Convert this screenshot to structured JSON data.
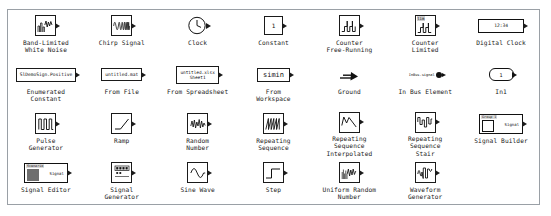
{
  "panel": {
    "title": "Sources",
    "columns": 7,
    "rows": 4,
    "border_color": "#9aa0a6",
    "background": "#ffffff",
    "text_color": "#1a1a1a"
  },
  "blocks": [
    {
      "id": "band-limited-white-noise",
      "label": "Band-Limited\nWhite Noise",
      "icon": "noise-waveform-icon",
      "value": ""
    },
    {
      "id": "chirp-signal",
      "label": "Chirp Signal",
      "icon": "chirp-waveform-icon",
      "value": ""
    },
    {
      "id": "clock",
      "label": "Clock",
      "icon": "clock-face-icon",
      "value": ""
    },
    {
      "id": "constant",
      "label": "Constant",
      "icon": "constant-value-icon",
      "value": "1"
    },
    {
      "id": "counter-free-running",
      "label": "Counter\nFree-Running",
      "icon": "counter-sawtooth-icon",
      "value": ""
    },
    {
      "id": "counter-limited",
      "label": "Counter\nLimited",
      "icon": "counter-limited-icon",
      "value": "lim"
    },
    {
      "id": "digital-clock",
      "label": "Digital Clock",
      "icon": "digital-clock-icon",
      "value": "12:34"
    },
    {
      "id": "enumerated-constant",
      "label": "Enumerated\nConstant",
      "icon": "enumerated-constant-icon",
      "value": "SlDemoSign.Positive"
    },
    {
      "id": "from-file",
      "label": "From File",
      "icon": "from-file-icon",
      "value": "untitled.mat"
    },
    {
      "id": "from-spreadsheet",
      "label": "From Spreadsheet",
      "icon": "from-spreadsheet-icon",
      "value": "untitled.xlsx\nSheet1"
    },
    {
      "id": "from-workspace",
      "label": "From\nWorkspace",
      "icon": "from-workspace-icon",
      "value": "simin"
    },
    {
      "id": "ground",
      "label": "Ground",
      "icon": "ground-arrow-icon",
      "value": ""
    },
    {
      "id": "in-bus-element",
      "label": "In Bus Element",
      "icon": "in-bus-element-icon",
      "value": "InBus.signal"
    },
    {
      "id": "in1",
      "label": "In1",
      "icon": "inport-icon",
      "value": "1"
    },
    {
      "id": "pulse-generator",
      "label": "Pulse\nGenerator",
      "icon": "pulse-train-icon",
      "value": ""
    },
    {
      "id": "ramp",
      "label": "Ramp",
      "icon": "ramp-icon",
      "value": ""
    },
    {
      "id": "random-number",
      "label": "Random\nNumber",
      "icon": "random-number-icon",
      "value": ""
    },
    {
      "id": "repeating-sequence",
      "label": "Repeating\nSequence",
      "icon": "repeating-sequence-icon",
      "value": ""
    },
    {
      "id": "repeating-sequence-interpolated",
      "label": "Repeating\nSequence\nInterpolated",
      "icon": "repeating-seq-interp-icon",
      "value": ""
    },
    {
      "id": "repeating-sequence-stair",
      "label": "Repeating\nSequence\nStair",
      "icon": "repeating-seq-stair-icon",
      "value": ""
    },
    {
      "id": "signal-builder",
      "label": "Signal Builder",
      "icon": "signal-builder-icon",
      "value": "Group 1",
      "port_label": "Signal"
    },
    {
      "id": "signal-editor",
      "label": "Signal Editor",
      "icon": "signal-editor-icon",
      "value": "Scenario",
      "port_label": "Signal"
    },
    {
      "id": "signal-generator",
      "label": "Signal\nGenerator",
      "icon": "signal-generator-icon",
      "value": ""
    },
    {
      "id": "sine-wave",
      "label": "Sine Wave",
      "icon": "sine-wave-icon",
      "value": ""
    },
    {
      "id": "step",
      "label": "Step",
      "icon": "step-icon",
      "value": ""
    },
    {
      "id": "uniform-random-number",
      "label": "Uniform Random\nNumber",
      "icon": "uniform-random-icon",
      "value": ""
    },
    {
      "id": "waveform-generator",
      "label": "Waveform\nGenerator",
      "icon": "waveform-generator-icon",
      "value": ""
    },
    {
      "id": "empty-slot",
      "label": "",
      "icon": "",
      "value": ""
    }
  ]
}
